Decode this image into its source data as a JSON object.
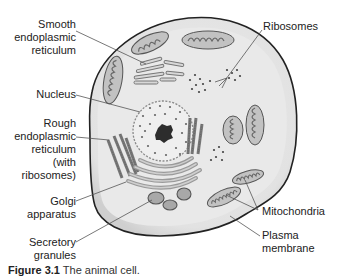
{
  "diagram": {
    "title": "Animal cell",
    "colors": {
      "cytoplasm": "#e6e6e6",
      "membrane_rim": "#d2d2d2",
      "outline": "#222222",
      "organelle_fill": "#bdbdbd",
      "organelle_dark": "#8a8a8a",
      "nucleus_fill": "#efefef",
      "nucleolus": "#333333",
      "leader_line": "#555555"
    },
    "labels_left": [
      {
        "id": "smooth-er",
        "lines": [
          "Smooth",
          "endoplasmic",
          "reticulum"
        ]
      },
      {
        "id": "nucleus",
        "lines": [
          "Nucleus"
        ]
      },
      {
        "id": "rough-er",
        "lines": [
          "Rough",
          "endoplasmic",
          "reticulum",
          "(with",
          "ribosomes)"
        ]
      },
      {
        "id": "golgi",
        "lines": [
          "Golgi",
          "apparatus"
        ]
      },
      {
        "id": "secretory-granules",
        "lines": [
          "Secretory",
          "granules"
        ]
      }
    ],
    "labels_right": [
      {
        "id": "ribosomes",
        "lines": [
          "Ribosomes"
        ]
      },
      {
        "id": "mitochondria",
        "lines": [
          "Mitochondria"
        ]
      },
      {
        "id": "plasma-membrane",
        "lines": [
          "Plasma",
          "membrane"
        ]
      }
    ],
    "caption": {
      "figure_number": "Figure 3.1",
      "text": "The animal cell."
    }
  }
}
